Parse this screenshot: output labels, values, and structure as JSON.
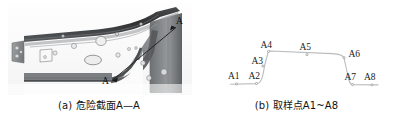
{
  "figure": {
    "background_color": "#ffffff",
    "panels": [
      {
        "id": "panel-a",
        "caption": "(a) 危险截面A—A",
        "caption_prefix": "(a)",
        "type": "photograph",
        "subject": "automotive sheet-metal bracket / rail section",
        "annotations": {
          "section_line_label_start": "A",
          "section_line_label_end": "A",
          "section_name": "A—A"
        },
        "photo": {
          "frame": {
            "x": 8,
            "y": 6,
            "w": 182,
            "h": 88
          },
          "base_gray": "#8d8f90",
          "dark_gray": "#3c3e40",
          "mid_gray": "#6f7274",
          "light_gray": "#c3c5c6",
          "highlight_gray": "#e4e5e6"
        }
      },
      {
        "id": "panel-b",
        "caption": "(b) 取样点A1~A8",
        "caption_prefix": "(b)",
        "type": "line-profile",
        "description": "cross-section hat profile with eight sampling points",
        "line_color": "#b9bbbd",
        "point_color": "#8d8f91",
        "label_color": "#1a1a1a",
        "points": [
          {
            "name": "A1",
            "x": 236.5,
            "y": 84.0,
            "label_x": 228.0,
            "label_y": 79.0
          },
          {
            "name": "A2",
            "x": 256.5,
            "y": 83.5,
            "label_x": 249.0,
            "label_y": 78.5
          },
          {
            "name": "A3",
            "x": 262.5,
            "y": 66.0,
            "label_x": 252.0,
            "label_y": 64.0
          },
          {
            "name": "A4",
            "x": 268.5,
            "y": 51.5,
            "label_x": 261.0,
            "label_y": 47.5
          },
          {
            "name": "A5",
            "x": 307.0,
            "y": 54.5,
            "label_x": 300.0,
            "label_y": 50.0
          },
          {
            "name": "A6",
            "x": 344.0,
            "y": 57.5,
            "label_x": 349.0,
            "label_y": 57.0
          },
          {
            "name": "A7",
            "x": 352.5,
            "y": 84.5,
            "label_x": 345.0,
            "label_y": 80.0
          },
          {
            "name": "A8",
            "x": 372.0,
            "y": 84.5,
            "label_x": 365.0,
            "label_y": 80.0
          }
        ],
        "profile_path": "M 230.5 84.3 L 257.0 83.6 C 261.5 83.2 263.0 76.0 264.5 66.0 L 268.3 51.6 C 268.6 51.2 269.2 51.0 270.5 51.0 L 332.0 53.6 C 339.5 53.9 343.4 55.2 344.0 58.0 L 348.5 78.5 C 349.6 83.0 350.6 84.6 352.6 84.7 L 378.0 84.9"
      }
    ]
  }
}
